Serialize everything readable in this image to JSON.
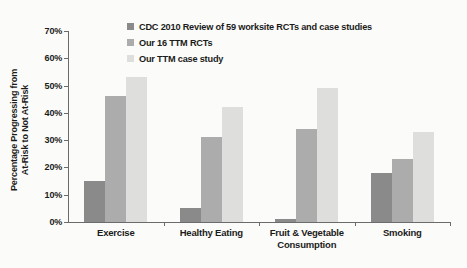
{
  "background": "#fbfbf9",
  "text_color": "#1b1b1b",
  "axis_color": "#6b6b6b",
  "chart_data": {
    "type": "bar",
    "title": "",
    "ylabel": "Percentage Progressing from At-Risk to Not At-Risk",
    "ylabel_line1": "Percentage Progressing from",
    "ylabel_line2": "At-Risk to Not At-Risk",
    "xlabel": "",
    "categories": [
      "Exercise",
      "Healthy Eating",
      "Fruit & Vegetable\nConsumption",
      "Smoking"
    ],
    "series": [
      {
        "name": "CDC 2010 Review of 59 worksite RCTs and case studies",
        "color": "#8a8a8a",
        "values": [
          15,
          5,
          1,
          18
        ]
      },
      {
        "name": "Our 16 TTM RCTs",
        "color": "#acacac",
        "values": [
          46,
          31,
          34,
          23
        ]
      },
      {
        "name": "Our TTM case study",
        "color": "#dededc",
        "values": [
          53,
          42,
          49,
          33
        ]
      }
    ],
    "ylim": [
      0,
      70
    ],
    "ytick_step": 10,
    "ytick_labels": [
      "0%",
      "10%",
      "20%",
      "30%",
      "40%",
      "50%",
      "60%",
      "70%"
    ],
    "legend_position": "top",
    "grid": false
  }
}
